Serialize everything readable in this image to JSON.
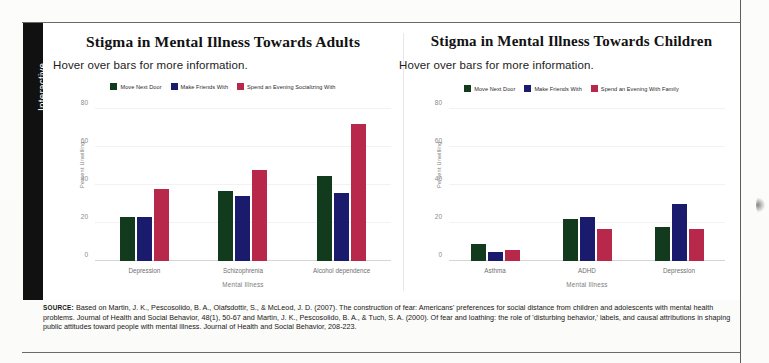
{
  "sidebar": {
    "tab_label": "Interactive"
  },
  "colors": {
    "move_next_door": "#123a1c",
    "make_friends_with": "#1b1b6e",
    "spend_evening": "#b8284a",
    "tab_background": "#111111",
    "axis": "#d5d5d5"
  },
  "source": {
    "label": "SOURCE:",
    "text": " Based on Martin, J. K., Pescosolido, B. A., Olafsdottir, S., & McLeod, J. D. (2007). The construction of fear: Americans' preferences for social distance from children and adolescents with mental health problems. Journal of Health and Social Behavior, 48(1), 50-67 and Martin, J. K., Pescosolido, B. A., & Tuch, S. A. (2000). Of fear and loathing: the role of 'disturbing behavior,' labels, and causal attributions in shaping public attitudes toward people with mental illness. Journal of Health and Social Behavior, 208-223."
  },
  "chart_data": [
    {
      "id": "adults",
      "type": "bar",
      "title": "Stigma in Mental Illness Towards Adults",
      "subtitle": "Hover over bars for more information.",
      "xlabel": "Mental Illness",
      "ylabel": "Percent Unwilling",
      "ylim": [
        0,
        80
      ],
      "yticks": [
        0,
        20,
        40,
        60,
        80
      ],
      "grid": true,
      "legend_position": "top-center",
      "categories": [
        "Depression",
        "Schizophrenia",
        "Alcohol dependence"
      ],
      "series": [
        {
          "name": "Move Next Door",
          "color": "#123a1c",
          "values": [
            23,
            37,
            45
          ]
        },
        {
          "name": "Make Friends With",
          "color": "#1b1b6e",
          "values": [
            23,
            34,
            36
          ]
        },
        {
          "name": "Spend an Evening Socializing With",
          "color": "#b8284a",
          "values": [
            38,
            48,
            72
          ]
        }
      ]
    },
    {
      "id": "children",
      "type": "bar",
      "title": "Stigma in Mental Illness Towards Children",
      "subtitle": "Hover over bars for more information.",
      "xlabel": "Mental Illness",
      "ylabel": "Percent Unwilling",
      "ylim": [
        0,
        80
      ],
      "yticks": [
        0,
        20,
        40,
        60,
        80
      ],
      "grid": true,
      "legend_position": "top-center",
      "categories": [
        "Asthma",
        "ADHD",
        "Depression"
      ],
      "series": [
        {
          "name": "Move Next Door",
          "color": "#123a1c",
          "values": [
            9,
            22,
            18
          ]
        },
        {
          "name": "Make Friends With",
          "color": "#1b1b6e",
          "values": [
            5,
            23,
            30
          ]
        },
        {
          "name": "Spend an Evening With Family",
          "color": "#b8284a",
          "values": [
            6,
            17,
            17
          ]
        }
      ]
    }
  ]
}
